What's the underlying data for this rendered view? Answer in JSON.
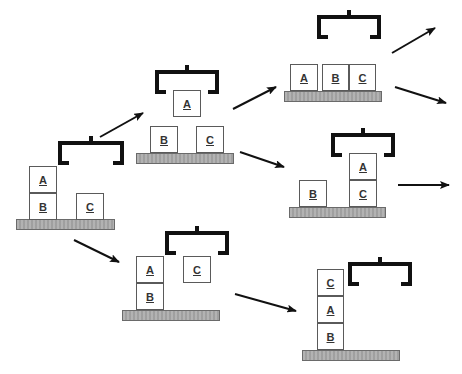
{
  "diagram": {
    "type": "blocks-world-state-transition",
    "colors": {
      "block_border": "#5a5a5a",
      "table_fill": "#a8a8a8",
      "gripper": "#111111",
      "arrow": "#111111",
      "text": "#333333"
    },
    "states": [
      {
        "id": "s0",
        "table": {
          "x": 16,
          "y": 219,
          "w": 99,
          "h": 11
        },
        "gripper": {
          "x": 60,
          "y": 143,
          "w": 62,
          "holding": null
        },
        "blocks": [
          {
            "label": "A",
            "x": 29,
            "y": 166,
            "w": 28,
            "h": 27
          },
          {
            "label": "B",
            "x": 29,
            "y": 193,
            "w": 28,
            "h": 27
          },
          {
            "label": "C",
            "x": 76,
            "y": 193,
            "w": 28,
            "h": 27
          }
        ]
      },
      {
        "id": "s1",
        "table": {
          "x": 136,
          "y": 153,
          "w": 98,
          "h": 11
        },
        "gripper": {
          "x": 157,
          "y": 72,
          "w": 60,
          "holding": "A"
        },
        "blocks": [
          {
            "label": "A",
            "x": 173,
            "y": 90,
            "w": 28,
            "h": 27
          },
          {
            "label": "B",
            "x": 150,
            "y": 126,
            "w": 28,
            "h": 27
          },
          {
            "label": "C",
            "x": 196,
            "y": 126,
            "w": 28,
            "h": 27
          }
        ]
      },
      {
        "id": "s2",
        "table": {
          "x": 284,
          "y": 91,
          "w": 98,
          "h": 11
        },
        "gripper": {
          "x": 319,
          "y": 17,
          "w": 60,
          "holding": null
        },
        "blocks": [
          {
            "label": "A",
            "x": 290,
            "y": 64,
            "w": 28,
            "h": 27
          },
          {
            "label": "B",
            "x": 322,
            "y": 64,
            "w": 27,
            "h": 27
          },
          {
            "label": "C",
            "x": 349,
            "y": 64,
            "w": 27,
            "h": 27
          }
        ]
      },
      {
        "id": "s3",
        "table": {
          "x": 289,
          "y": 207,
          "w": 97,
          "h": 11
        },
        "gripper": {
          "x": 333,
          "y": 135,
          "w": 60,
          "holding": "A"
        },
        "blocks": [
          {
            "label": "A",
            "x": 349,
            "y": 153,
            "w": 28,
            "h": 27
          },
          {
            "label": "C",
            "x": 349,
            "y": 180,
            "w": 28,
            "h": 27
          },
          {
            "label": "B",
            "x": 299,
            "y": 180,
            "w": 28,
            "h": 27
          }
        ]
      },
      {
        "id": "s4",
        "table": {
          "x": 122,
          "y": 310,
          "w": 98,
          "h": 11
        },
        "gripper": {
          "x": 167,
          "y": 233,
          "w": 60,
          "holding": "C"
        },
        "blocks": [
          {
            "label": "A",
            "x": 136,
            "y": 256,
            "w": 28,
            "h": 27
          },
          {
            "label": "B",
            "x": 136,
            "y": 283,
            "w": 28,
            "h": 27
          },
          {
            "label": "C",
            "x": 183,
            "y": 256,
            "w": 28,
            "h": 27
          }
        ]
      },
      {
        "id": "s5",
        "table": {
          "x": 302,
          "y": 350,
          "w": 98,
          "h": 11
        },
        "gripper": {
          "x": 350,
          "y": 264,
          "w": 60,
          "holding": null
        },
        "blocks": [
          {
            "label": "C",
            "x": 317,
            "y": 269,
            "w": 27,
            "h": 27
          },
          {
            "label": "A",
            "x": 317,
            "y": 296,
            "w": 27,
            "h": 27
          },
          {
            "label": "B",
            "x": 317,
            "y": 323,
            "w": 27,
            "h": 27
          }
        ]
      }
    ],
    "arrows": [
      {
        "from": "s0",
        "to": "s1",
        "x1": 100,
        "y1": 137,
        "x2": 143,
        "y2": 113
      },
      {
        "from": "s0",
        "to": "s4",
        "x1": 74,
        "y1": 240,
        "x2": 119,
        "y2": 262
      },
      {
        "from": "s1",
        "to": "s2",
        "x1": 233,
        "y1": 109,
        "x2": 276,
        "y2": 87
      },
      {
        "from": "s1",
        "to": "s3",
        "x1": 240,
        "y1": 152,
        "x2": 284,
        "y2": 167
      },
      {
        "from": "s4",
        "to": "s5",
        "x1": 235,
        "y1": 294,
        "x2": 296,
        "y2": 311
      },
      {
        "from": "s2",
        "to": "out-1",
        "x1": 392,
        "y1": 53,
        "x2": 435,
        "y2": 28
      },
      {
        "from": "s2",
        "to": "out-2",
        "x1": 395,
        "y1": 87,
        "x2": 446,
        "y2": 103
      },
      {
        "from": "s3",
        "to": "out-3",
        "x1": 398,
        "y1": 185,
        "x2": 449,
        "y2": 185
      }
    ]
  }
}
